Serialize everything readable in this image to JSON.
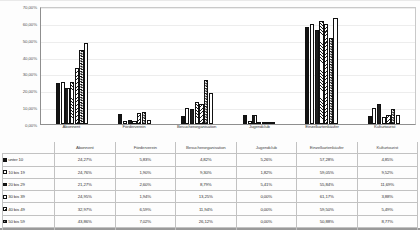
{
  "chart_data": {
    "type": "bar",
    "title": "",
    "xlabel": "",
    "ylabel": "",
    "ylim": [
      0,
      0.7
    ],
    "grid": true,
    "legend_position": "bottom-table",
    "value_format": "percent",
    "categories": [
      "Abonnent",
      "Förderverein",
      "Besucherorganisation",
      "Jugendclub",
      "Einzelkartenkäufer",
      "Kulturtourist"
    ],
    "ytick_labels": [
      "0,00%",
      "10,00%",
      "20,00%",
      "30,00%",
      "40,00%",
      "50,00%",
      "60,00%",
      "70,00%"
    ],
    "ytick_values": [
      0,
      10,
      20,
      30,
      40,
      50,
      60,
      70
    ],
    "series": [
      {
        "name": "unter 10",
        "pattern": "solid-black",
        "values": [
          24.27,
          5.83,
          4.82,
          5.26,
          57.28,
          4.85
        ],
        "labels": [
          "24,27%",
          "5,83%",
          "4,82%",
          "5,26%",
          "57,28%",
          "4,85%"
        ]
      },
      {
        "name": "10 bis 19",
        "pattern": "white",
        "values": [
          24.76,
          1.9,
          9.3,
          1.82,
          59.05,
          9.52
        ],
        "labels": [
          "24,76%",
          "1,90%",
          "9,30%",
          "1,82%",
          "59,05%",
          "9,52%"
        ]
      },
      {
        "name": "20 bis 29",
        "pattern": "vertical-hatch",
        "values": [
          21.27,
          2.6,
          8.79,
          5.41,
          55.84,
          11.69
        ],
        "labels": [
          "21,27%",
          "2,60%",
          "8,79%",
          "5,41%",
          "55,84%",
          "11,69%"
        ]
      },
      {
        "name": "30 bis 39",
        "pattern": "cross-hatch",
        "values": [
          24.95,
          1.94,
          13.25,
          0.0,
          61.17,
          3.88
        ],
        "labels": [
          "24,95%",
          "1,94%",
          "13,25%",
          "0,00%",
          "61,17%",
          "3,88%"
        ]
      },
      {
        "name": "40 bis 49",
        "pattern": "diagonal-hatch",
        "values": [
          32.97,
          6.59,
          11.94,
          0.0,
          59.5,
          5.49
        ],
        "labels": [
          "32,97%",
          "6,59%",
          "11,94%",
          "0,00%",
          "59,50%",
          "5,49%"
        ]
      },
      {
        "name": "50 bis 59",
        "pattern": "checkerboard",
        "values": [
          43.86,
          7.02,
          26.12,
          0.0,
          50.88,
          8.77
        ],
        "labels": [
          "43,86%",
          "7,02%",
          "26,12%",
          "0,00%",
          "50,88%",
          "8,77%"
        ]
      },
      {
        "name": "ab 60",
        "pattern": "dotted",
        "values": [
          47.79,
          2.65,
          18.57,
          0.0,
          62.83,
          5.31
        ],
        "labels": [
          "47,79%",
          "2,65%",
          "18,57%",
          "0,00%",
          "62,83%",
          "5,31%"
        ]
      }
    ]
  }
}
